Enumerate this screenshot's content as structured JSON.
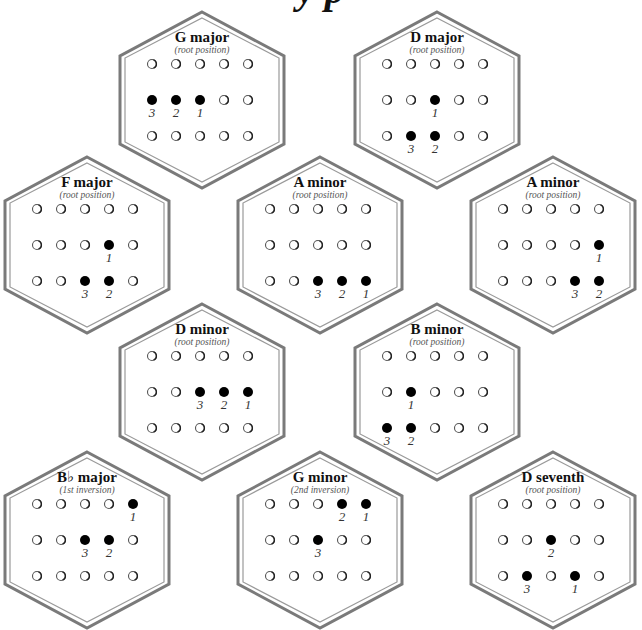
{
  "page": {
    "title_fragment": "y  p"
  },
  "grid": {
    "columns": 5,
    "rows": 3
  },
  "chords": [
    {
      "name": "G major",
      "position": "(root position)",
      "cx": 202,
      "cy": 100,
      "notes": [
        {
          "row": 1,
          "col": 0,
          "finger": "3"
        },
        {
          "row": 1,
          "col": 1,
          "finger": "2"
        },
        {
          "row": 1,
          "col": 2,
          "finger": "1"
        }
      ]
    },
    {
      "name": "D major",
      "position": "(root position)",
      "cx": 437,
      "cy": 100,
      "notes": [
        {
          "row": 1,
          "col": 2,
          "finger": "1"
        },
        {
          "row": 2,
          "col": 1,
          "finger": "3"
        },
        {
          "row": 2,
          "col": 2,
          "finger": "2"
        }
      ]
    },
    {
      "name": "F major",
      "position": "(root position)",
      "cx": 87,
      "cy": 245,
      "notes": [
        {
          "row": 1,
          "col": 3,
          "finger": "1"
        },
        {
          "row": 2,
          "col": 2,
          "finger": "3"
        },
        {
          "row": 2,
          "col": 3,
          "finger": "2"
        }
      ]
    },
    {
      "name": "A minor",
      "position": "(root position)",
      "cx": 320,
      "cy": 245,
      "notes": [
        {
          "row": 2,
          "col": 2,
          "finger": "3"
        },
        {
          "row": 2,
          "col": 3,
          "finger": "2"
        },
        {
          "row": 2,
          "col": 4,
          "finger": "1"
        }
      ]
    },
    {
      "name": "A minor",
      "position": "(root position)",
      "cx": 553,
      "cy": 245,
      "notes": [
        {
          "row": 1,
          "col": 4,
          "finger": "1"
        },
        {
          "row": 2,
          "col": 3,
          "finger": "3"
        },
        {
          "row": 2,
          "col": 4,
          "finger": "2"
        }
      ]
    },
    {
      "name": "D minor",
      "position": "(root position)",
      "cx": 202,
      "cy": 392,
      "notes": [
        {
          "row": 1,
          "col": 2,
          "finger": "3"
        },
        {
          "row": 1,
          "col": 3,
          "finger": "2"
        },
        {
          "row": 1,
          "col": 4,
          "finger": "1"
        }
      ]
    },
    {
      "name": "B minor",
      "position": "(root position)",
      "cx": 437,
      "cy": 392,
      "notes": [
        {
          "row": 1,
          "col": 1,
          "finger": "1"
        },
        {
          "row": 2,
          "col": 0,
          "finger": "3"
        },
        {
          "row": 2,
          "col": 1,
          "finger": "2"
        }
      ]
    },
    {
      "name": "B♭ major",
      "position": "(1st inversion)",
      "cx": 87,
      "cy": 540,
      "notes": [
        {
          "row": 0,
          "col": 4,
          "finger": "1"
        },
        {
          "row": 1,
          "col": 2,
          "finger": "3"
        },
        {
          "row": 1,
          "col": 3,
          "finger": "2"
        }
      ]
    },
    {
      "name": "G minor",
      "position": "(2nd inversion)",
      "cx": 320,
      "cy": 540,
      "notes": [
        {
          "row": 0,
          "col": 3,
          "finger": "2"
        },
        {
          "row": 0,
          "col": 4,
          "finger": "1"
        },
        {
          "row": 1,
          "col": 2,
          "finger": "3"
        }
      ]
    },
    {
      "name": "D seventh",
      "position": "(root position)",
      "cx": 553,
      "cy": 540,
      "notes": [
        {
          "row": 1,
          "col": 2,
          "finger": "2"
        },
        {
          "row": 2,
          "col": 1,
          "finger": "3"
        },
        {
          "row": 2,
          "col": 3,
          "finger": "1"
        }
      ]
    }
  ]
}
